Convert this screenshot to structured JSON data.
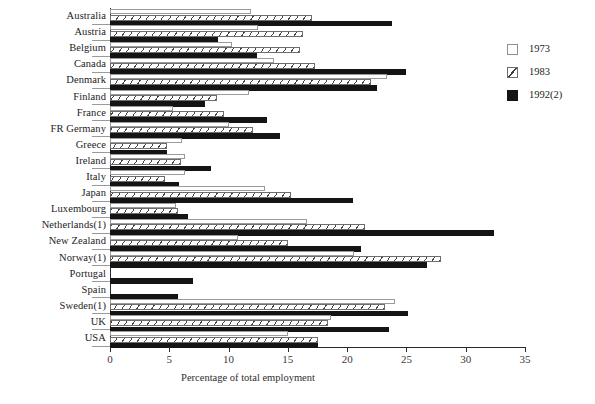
{
  "chart_data": {
    "type": "bar",
    "orientation": "horizontal",
    "title": "",
    "xlabel": "Percentage of  total employment",
    "ylabel": "",
    "xlim": [
      0,
      35
    ],
    "xticks": [
      0,
      5,
      10,
      15,
      20,
      25,
      30,
      35
    ],
    "grid": false,
    "legend_position": "right",
    "categories": [
      "Australia",
      "Austria",
      "Belgium",
      "Canada",
      "Denmark",
      "Finland",
      "France",
      "FR Germany",
      "Greece",
      "Ireland",
      "Italy",
      "Japan",
      "Luxembourg",
      "Netherlands(1)",
      "New Zealand",
      "Norway(1)",
      "Portugal",
      "Spain",
      "Sweden(1)",
      "UK",
      "USA"
    ],
    "series": [
      {
        "name": "1973",
        "color": "#ffffff",
        "values": [
          11.9,
          12.5,
          10.3,
          13.8,
          23.4,
          11.7,
          5.3,
          10.0,
          6.1,
          6.3,
          6.3,
          13.1,
          5.6,
          16.6,
          10.8,
          20.6,
          null,
          null,
          24.0,
          18.6,
          15.0
        ]
      },
      {
        "name": "1983",
        "color": "#ffffff",
        "values": [
          17.0,
          16.3,
          16.0,
          17.3,
          22.0,
          9.0,
          9.6,
          12.1,
          4.8,
          6.0,
          4.6,
          15.3,
          5.7,
          21.5,
          15.0,
          27.9,
          null,
          null,
          23.2,
          18.4,
          17.5
        ]
      },
      {
        "name": "1992(2)",
        "color": "#141414",
        "values": [
          23.8,
          9.1,
          12.4,
          25.0,
          22.5,
          8.0,
          13.2,
          14.3,
          4.8,
          8.5,
          5.8,
          20.5,
          6.6,
          32.4,
          21.2,
          26.7,
          7.0,
          5.7,
          25.1,
          23.5,
          17.5
        ]
      }
    ],
    "legend": [
      "1973",
      "1983",
      "1992(2)"
    ]
  },
  "axis": {
    "tick_labels": [
      "0",
      "5",
      "10",
      "15",
      "20",
      "25",
      "30",
      "35"
    ],
    "x_axis_title": "Percentage of  total employment"
  },
  "legend": {
    "items": [
      {
        "label": "1973",
        "swatch": "empty-square-swatch"
      },
      {
        "label": "1983",
        "swatch": "hatched-square-swatch"
      },
      {
        "label": "1992(2)",
        "swatch": "filled-square-swatch"
      }
    ]
  }
}
